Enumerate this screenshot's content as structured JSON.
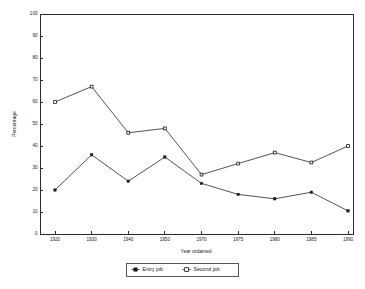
{
  "chart_data": {
    "type": "line",
    "title": "",
    "xlabel": "Year ordained",
    "ylabel": "Percentage",
    "categories": [
      "1920",
      "1930",
      "1940",
      "1950",
      "1970",
      "1975",
      "1980",
      "1985",
      "1990"
    ],
    "x": [
      1920,
      1930,
      1940,
      1950,
      1970,
      1975,
      1980,
      1985,
      1990
    ],
    "xlim": [
      0,
      8
    ],
    "ylim": [
      0,
      100
    ],
    "ytick_labels": [
      "0",
      "10",
      "20",
      "30",
      "40",
      "50",
      "60",
      "70",
      "80",
      "90",
      "100"
    ],
    "yticks": [
      0,
      10,
      20,
      30,
      40,
      50,
      60,
      70,
      80,
      90,
      100
    ],
    "grid": false,
    "legend_position": "bottom-center",
    "series": [
      {
        "name": "Entry job",
        "marker": "filled-square",
        "values": [
          20,
          36,
          24,
          35,
          23,
          18,
          16,
          19,
          10.5
        ]
      },
      {
        "name": "Second job",
        "marker": "open-square",
        "values": [
          60,
          67,
          46,
          48,
          27,
          32,
          37,
          32.5,
          40
        ]
      }
    ]
  },
  "legend": {
    "entries": [
      {
        "label": "Entry job",
        "marker": "filled-square"
      },
      {
        "label": "Second job",
        "marker": "open-square"
      }
    ]
  },
  "colors": {
    "line": "#1a1a1a",
    "axis": "#2b2b2b",
    "background": "#ffffff"
  }
}
